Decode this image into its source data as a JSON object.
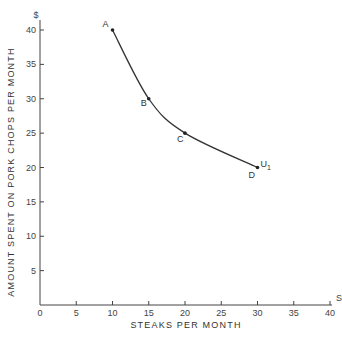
{
  "chart_data": {
    "type": "line",
    "title": "",
    "xlabel": "STEAKS PER MONTH",
    "ylabel": "AMOUNT SPENT ON PORK CHOPS PER MONTH",
    "x_axis_unit": "S",
    "y_axis_unit": "$",
    "xlim": [
      0,
      40
    ],
    "ylim": [
      0,
      40
    ],
    "x_ticks": [
      "0",
      "5",
      "10",
      "15",
      "20",
      "25",
      "30",
      "35",
      "40"
    ],
    "y_ticks": [
      "5",
      "10",
      "15",
      "20",
      "25",
      "30",
      "35",
      "40"
    ],
    "grid": false,
    "series": [
      {
        "name": "U1",
        "label": "U",
        "label_sub": "1",
        "points": [
          {
            "label": "A",
            "x": 10,
            "y": 40
          },
          {
            "label": "B",
            "x": 15,
            "y": 30
          },
          {
            "label": "C",
            "x": 20,
            "y": 25
          },
          {
            "label": "D",
            "x": 30,
            "y": 20
          }
        ]
      }
    ]
  }
}
